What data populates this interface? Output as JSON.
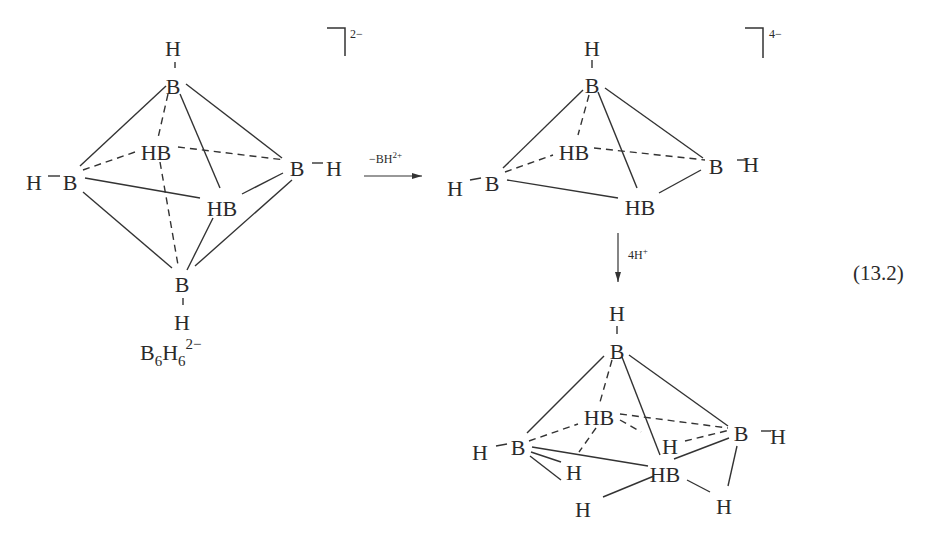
{
  "figure": {
    "equation_number": "(13.2)",
    "colors": {
      "ink": "#2a2a2a",
      "background": "#ffffff"
    }
  },
  "reactant": {
    "name": "B6H6 2- octahedron",
    "charge": "2−",
    "formula": {
      "B": "B",
      "B_sub": "6",
      "H": "H",
      "H_sub": "6",
      "charge": "2−"
    },
    "atoms": [
      {
        "id": "Htop",
        "label": "H",
        "x": 173,
        "y": 48
      },
      {
        "id": "Btop",
        "label": "B",
        "x": 173,
        "y": 86
      },
      {
        "id": "Bleft",
        "label": "B",
        "x": 70,
        "y": 182
      },
      {
        "id": "Hleft",
        "label": "H",
        "x": 34,
        "y": 182
      },
      {
        "id": "HBback",
        "label": "HB",
        "x": 156,
        "y": 152
      },
      {
        "id": "Bright",
        "label": "B",
        "x": 297,
        "y": 168
      },
      {
        "id": "Hright",
        "label": "H",
        "x": 334,
        "y": 168
      },
      {
        "id": "HBfront",
        "label": "HB",
        "x": 222,
        "y": 208
      },
      {
        "id": "Bbot",
        "label": "B",
        "x": 182,
        "y": 284
      },
      {
        "id": "Hbot",
        "label": "H",
        "x": 182,
        "y": 322
      }
    ],
    "bonds_solid": [
      [
        175,
        62,
        175,
        68
      ],
      [
        166,
        86,
        80,
        166
      ],
      [
        186,
        84,
        282,
        158
      ],
      [
        180,
        94,
        220,
        188
      ],
      [
        85,
        178,
        200,
        198
      ],
      [
        83,
        192,
        172,
        268
      ],
      [
        242,
        194,
        283,
        173
      ],
      [
        292,
        180,
        195,
        266
      ],
      [
        213,
        218,
        187,
        270
      ],
      [
        48,
        176,
        60,
        176
      ],
      [
        312,
        163,
        323,
        163
      ],
      [
        183,
        298,
        183,
        305
      ]
    ],
    "bonds_dashed": [
      [
        168,
        94,
        158,
        138
      ],
      [
        83,
        170,
        135,
        152
      ],
      [
        178,
        147,
        285,
        160
      ],
      [
        160,
        162,
        178,
        265
      ]
    ]
  },
  "step1": {
    "reagent": "−BH",
    "reagent_charge": "2+",
    "arrow": {
      "x1": 364,
      "y1": 176,
      "x2": 422,
      "y2": 176
    }
  },
  "intermediate": {
    "name": "B5H5 4- square pyramid",
    "charge": "4−",
    "atoms": [
      {
        "id": "Htop",
        "label": "H",
        "x": 592,
        "y": 48
      },
      {
        "id": "Btop",
        "label": "B",
        "x": 592,
        "y": 85
      },
      {
        "id": "Bleft",
        "label": "B",
        "x": 492,
        "y": 183
      },
      {
        "id": "Hleft",
        "label": "H",
        "x": 455,
        "y": 188
      },
      {
        "id": "HBback",
        "label": "HB",
        "x": 574,
        "y": 152
      },
      {
        "id": "Bright",
        "label": "B",
        "x": 716,
        "y": 166
      },
      {
        "id": "Hright",
        "label": "H",
        "x": 751,
        "y": 164
      },
      {
        "id": "HBfront",
        "label": "HB",
        "x": 640,
        "y": 207
      }
    ],
    "bonds_solid": [
      [
        592,
        60,
        592,
        68
      ],
      [
        583,
        90,
        503,
        168
      ],
      [
        605,
        88,
        703,
        158
      ],
      [
        598,
        92,
        637,
        188
      ],
      [
        507,
        180,
        618,
        198
      ],
      [
        659,
        193,
        701,
        170
      ],
      [
        470,
        180,
        481,
        178
      ],
      [
        737,
        160,
        746,
        160
      ]
    ],
    "bonds_dashed": [
      [
        589,
        95,
        578,
        135
      ],
      [
        505,
        172,
        553,
        155
      ],
      [
        594,
        148,
        705,
        160
      ]
    ]
  },
  "step2": {
    "reagent": "4H",
    "reagent_charge": "+",
    "arrow": {
      "x1": 618,
      "y1": 233,
      "x2": 618,
      "y2": 282
    }
  },
  "product": {
    "name": "B5H9 nido",
    "atoms": [
      {
        "id": "Htop",
        "label": "H",
        "x": 617,
        "y": 313
      },
      {
        "id": "Btop",
        "label": "B",
        "x": 617,
        "y": 351
      },
      {
        "id": "Bleft",
        "label": "B",
        "x": 518,
        "y": 447
      },
      {
        "id": "Hleft",
        "label": "H",
        "x": 480,
        "y": 452
      },
      {
        "id": "HBback",
        "label": "HB",
        "x": 599,
        "y": 417
      },
      {
        "id": "Bright",
        "label": "B",
        "x": 741,
        "y": 433
      },
      {
        "id": "Hright",
        "label": "H",
        "x": 778,
        "y": 436
      },
      {
        "id": "Hmid",
        "label": "H",
        "x": 670,
        "y": 446
      },
      {
        "id": "HBfront",
        "label": "HB",
        "x": 665,
        "y": 474
      },
      {
        "id": "Hbr1",
        "label": "H",
        "x": 574,
        "y": 472
      },
      {
        "id": "Hbr2",
        "label": "H",
        "x": 583,
        "y": 509
      },
      {
        "id": "Hbr3",
        "label": "H",
        "x": 724,
        "y": 506
      }
    ],
    "bonds_solid": [
      [
        617,
        326,
        617,
        334
      ],
      [
        604,
        356,
        527,
        433
      ],
      [
        629,
        355,
        728,
        426
      ],
      [
        622,
        357,
        660,
        455
      ],
      [
        532,
        447,
        648,
        466
      ],
      [
        531,
        452,
        561,
        462
      ],
      [
        530,
        456,
        561,
        480
      ],
      [
        654,
        476,
        603,
        497
      ],
      [
        674,
        459,
        729,
        438
      ],
      [
        687,
        480,
        710,
        492
      ],
      [
        737,
        446,
        728,
        486
      ],
      [
        496,
        446,
        507,
        444
      ],
      [
        761,
        431,
        771,
        431
      ]
    ],
    "bonds_dashed": [
      [
        612,
        360,
        600,
        402
      ],
      [
        529,
        441,
        578,
        424
      ],
      [
        620,
        414,
        728,
        428
      ],
      [
        596,
        428,
        579,
        452
      ],
      [
        620,
        420,
        641,
        432
      ],
      [
        685,
        441,
        730,
        430
      ]
    ]
  }
}
